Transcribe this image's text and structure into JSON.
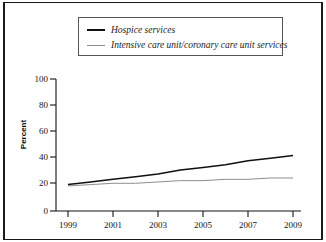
{
  "legend": {
    "entries": [
      {
        "label": "Hospice services",
        "swatch": "thick-black-line",
        "color": "#101010"
      },
      {
        "label": "Intensive care unit/coronary care unit services",
        "swatch": "thin-gray-line",
        "color": "#8d8d8d"
      }
    ]
  },
  "axes": {
    "ylabel": "Percent",
    "yticks": [
      "0",
      "20",
      "40",
      "60",
      "80",
      "100"
    ],
    "xticks": [
      "1999",
      "2001",
      "2003",
      "2005",
      "2007",
      "2009"
    ]
  },
  "chart_data": {
    "type": "line",
    "title": "",
    "subtitle": "",
    "xlabel": "",
    "ylabel": "Percent",
    "xlim": [
      1999,
      2009
    ],
    "ylim": [
      0,
      100
    ],
    "grid": false,
    "legend_position": "top-center",
    "x": [
      1999,
      2000,
      2001,
      2002,
      2003,
      2004,
      2005,
      2006,
      2007,
      2008,
      2009
    ],
    "series": [
      {
        "name": "Hospice services",
        "color": "#101010",
        "values": [
          20,
          22,
          24,
          26,
          28,
          31,
          33,
          35,
          38,
          40,
          42
        ]
      },
      {
        "name": "Intensive care unit/coronary care unit services",
        "color": "#8d8d8d",
        "values": [
          19,
          20,
          21,
          21,
          22,
          23,
          23,
          24,
          24,
          25,
          25
        ]
      }
    ],
    "annotations": []
  }
}
